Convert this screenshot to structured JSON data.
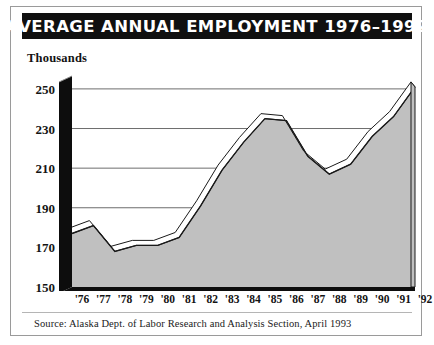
{
  "title": "AVERAGE ANNUAL EMPLOYMENT 1976–1992",
  "y_axis_unit": "Thousands",
  "source": "Source: Alaska Dept. of Labor Research and Analysis Section, April 1993",
  "colors": {
    "title_bar": "#101010",
    "title_text": "#ffffff",
    "area_fill": "#c0c0c0",
    "ribbon_top": "#ffffff",
    "line": "#1a1a1a",
    "gridline": "#6d6d6d",
    "axis_black": "#0d0d0d",
    "frame": "#9a9a9a",
    "page_background": "#ffffff"
  },
  "chart_data": {
    "type": "area",
    "title": "AVERAGE ANNUAL EMPLOYMENT 1976–1992",
    "subtitle": "",
    "xlabel": "",
    "ylabel": "Thousands",
    "ylim": [
      150,
      255
    ],
    "xlim": [
      "'76",
      "'92"
    ],
    "grid": true,
    "legend": "none",
    "yticks": [
      150,
      170,
      190,
      210,
      230,
      250
    ],
    "ytick_labels": [
      "150",
      "170",
      "190",
      "210",
      "230",
      "250"
    ],
    "categories": [
      "'76",
      "'77",
      "'78",
      "'79",
      "'80",
      "'81",
      "'82",
      "'83",
      "'84",
      "'85",
      "'86",
      "'87",
      "'88",
      "'89",
      "'90",
      "'91",
      "'92"
    ],
    "series": [
      {
        "name": "Average Annual Employment",
        "units": "thousands",
        "values": [
          177,
          181,
          168,
          171,
          171,
          175,
          191,
          209,
          223,
          235,
          234,
          216,
          207,
          212,
          226,
          236,
          251
        ]
      }
    ],
    "annotations": []
  }
}
